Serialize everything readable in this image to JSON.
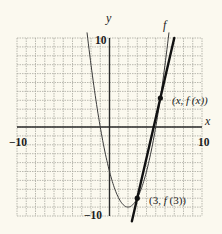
{
  "chart_data": {
    "type": "line",
    "title": "",
    "xlabel": "x",
    "ylabel": "y",
    "xlim": [
      -10,
      10
    ],
    "ylim": [
      -10,
      10
    ],
    "grid": true,
    "grid_step": 1,
    "x_tick_labels": [
      "-10",
      "10"
    ],
    "y_tick_labels": [
      "10",
      "-10"
    ],
    "series": [
      {
        "name": "f",
        "style": "thin curve",
        "function": "(x-2)^2 - 9",
        "points": [
          [
            -2.4,
            10.4
          ],
          [
            -2,
            7
          ],
          [
            -1,
            0
          ],
          [
            0,
            -5
          ],
          [
            1,
            -8
          ],
          [
            2,
            -9
          ],
          [
            3,
            -8
          ],
          [
            4,
            -5
          ],
          [
            5,
            0
          ],
          [
            6,
            7
          ],
          [
            6.4,
            10.4
          ]
        ]
      },
      {
        "name": "secant line",
        "style": "bold line",
        "points": [
          [
            2.42,
            -10.6
          ],
          [
            3,
            -8
          ],
          [
            5.5,
            3.25
          ],
          [
            7,
            10
          ]
        ]
      }
    ],
    "annotations": [
      {
        "text": "(3, f (3))",
        "point": [
          3,
          -8
        ]
      },
      {
        "text": "(x, f (x))",
        "point": [
          5.5,
          3.25
        ]
      },
      {
        "text": "f",
        "point": [
          6.2,
          11.5
        ]
      }
    ]
  },
  "labels": {
    "y_axis": "y",
    "x_axis": "x",
    "curve_name": "f",
    "y_top": "10",
    "y_bottom": "−10",
    "x_left": "−10",
    "x_right": "10",
    "point_a_open": "(3, ",
    "point_a_f": "f",
    "point_a_close": " (3))",
    "point_b_open": "(x, ",
    "point_b_f": "f",
    "point_b_close": " (x))"
  },
  "colors": {
    "background": "#fbf9ef",
    "grid": "#a9a89f",
    "axis": "#2a2a2a",
    "curve": "#3a3a3a",
    "secant": "#111111"
  }
}
